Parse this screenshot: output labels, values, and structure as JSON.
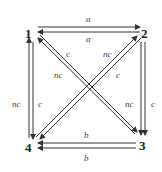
{
  "diagram": {
    "nodes": [
      {
        "id": "1",
        "label": "1",
        "x": 31,
        "y": 37
      },
      {
        "id": "2",
        "label": "2",
        "x": 145,
        "y": 37
      },
      {
        "id": "3",
        "label": "3",
        "x": 143,
        "y": 149
      },
      {
        "id": "4",
        "label": "4",
        "x": 31,
        "y": 151
      }
    ],
    "edges": [
      {
        "from": "1",
        "to": "2",
        "label": "a"
      },
      {
        "from": "2",
        "to": "1",
        "label": "a"
      },
      {
        "from": "4",
        "to": "1",
        "label": "nc"
      },
      {
        "from": "1",
        "to": "4",
        "label": "c"
      },
      {
        "from": "2",
        "to": "3",
        "label": "nc"
      },
      {
        "from": "2",
        "to": "3",
        "label": "c"
      },
      {
        "from": "3",
        "to": "4",
        "label": "b"
      },
      {
        "from": "3",
        "to": "4",
        "label": "b"
      },
      {
        "from": "3",
        "to": "1",
        "label": "c"
      },
      {
        "from": "1",
        "to": "3",
        "label": "nc"
      },
      {
        "from": "4",
        "to": "2",
        "label": "nc"
      },
      {
        "from": "2",
        "to": "4",
        "label": "c"
      }
    ],
    "labels": {
      "top_upper": "a",
      "top_lower": "a",
      "left_outer": "nc",
      "left_inner": "c",
      "right_inner": "nc",
      "right_outer": "c",
      "bottom_upper": "b",
      "bottom_lower": "b",
      "diag_13_upper": "c",
      "diag_24_upper": "nc",
      "diag_13_lower": "nc",
      "diag_24_lower": "c"
    }
  }
}
